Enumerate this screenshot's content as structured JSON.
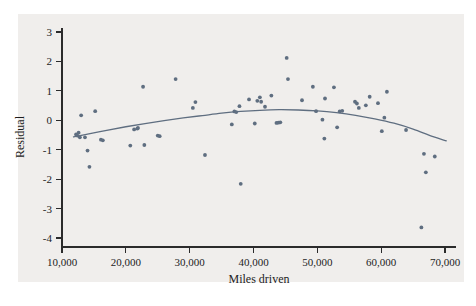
{
  "figure": {
    "background_color": "#ffffff",
    "panel_color": "#f0eeec",
    "caption_partial": ""
  },
  "chart_data": {
    "type": "scatter",
    "title": "",
    "xlabel": "Miles driven",
    "ylabel": "Residual",
    "xlim": [
      8800,
      71800
    ],
    "ylim": [
      -4.25,
      3.2
    ],
    "xticks": [
      10000,
      20000,
      30000,
      40000,
      50000,
      60000,
      70000
    ],
    "xtick_labels": [
      "10,000",
      "20,000",
      "30,000",
      "40,000",
      "50,000",
      "60,000",
      "70,000"
    ],
    "yticks": [
      3,
      2,
      1,
      0,
      -1,
      -2,
      -3,
      -4
    ],
    "ytick_labels": [
      "3",
      "2",
      "1",
      "0",
      "-1",
      "-2",
      "-3",
      "-4"
    ],
    "grid": false,
    "legend": null,
    "point_color": "#5f6e80",
    "curve_color": "#5f6e80",
    "x": [
      12200,
      12400,
      12600,
      12800,
      13000,
      13600,
      14000,
      14300,
      15200,
      16100,
      16400,
      20700,
      21300,
      21800,
      21900,
      22700,
      22900,
      25000,
      25300,
      27800,
      30500,
      30900,
      32400,
      36600,
      37000,
      37300,
      37800,
      38000,
      39300,
      40200,
      40600,
      41000,
      41200,
      41800,
      42800,
      43600,
      43900,
      44200,
      45200,
      45400,
      47600,
      49300,
      49800,
      50800,
      51100,
      51200,
      52600,
      53100,
      53500,
      53900,
      55900,
      56200,
      56500,
      57600,
      58200,
      59500,
      60100,
      60500,
      60900,
      63900,
      66300,
      66700,
      67000,
      68400
    ],
    "y": [
      -0.48,
      -0.52,
      -0.42,
      -0.58,
      0.17,
      -0.58,
      -1.03,
      -1.58,
      0.31,
      -0.66,
      -0.68,
      -0.86,
      -0.31,
      -0.28,
      -0.26,
      1.14,
      -0.84,
      -0.52,
      -0.54,
      1.4,
      0.42,
      0.62,
      -1.18,
      -0.14,
      0.3,
      0.28,
      0.48,
      -2.16,
      0.71,
      -0.11,
      0.66,
      0.78,
      0.63,
      0.46,
      0.84,
      -0.09,
      -0.08,
      -0.07,
      2.12,
      1.4,
      0.68,
      1.14,
      0.31,
      0.02,
      -0.62,
      0.74,
      1.12,
      -0.24,
      0.3,
      0.32,
      0.63,
      0.57,
      0.42,
      0.51,
      0.8,
      0.58,
      -0.37,
      0.09,
      0.97,
      -0.33,
      -3.64,
      -1.14,
      -1.77,
      -1.23
    ],
    "fit": {
      "kind": "lowess-quadratic",
      "description": "smoothed quadratic trend peaking near 43,000 miles",
      "points_x": [
        11800,
        14000,
        17000,
        20000,
        23000,
        26000,
        29000,
        32000,
        35000,
        38000,
        41000,
        44000,
        47000,
        50000,
        53000,
        56000,
        59000,
        62000,
        65000,
        68000,
        70200
      ],
      "points_y": [
        -0.56,
        -0.47,
        -0.34,
        -0.22,
        -0.11,
        -0.01,
        0.08,
        0.16,
        0.24,
        0.3,
        0.34,
        0.36,
        0.35,
        0.32,
        0.26,
        0.17,
        0.05,
        -0.1,
        -0.3,
        -0.55,
        -0.7
      ]
    }
  }
}
